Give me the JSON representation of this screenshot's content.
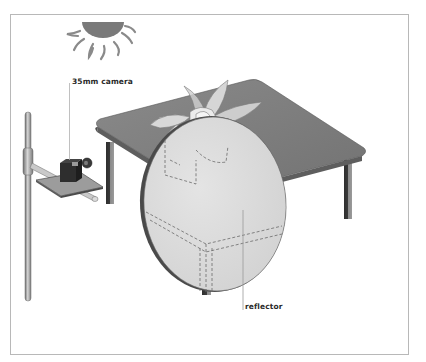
{
  "diagram": {
    "type": "illustration",
    "labels": {
      "camera": "35mm camera",
      "reflector": "reflector"
    },
    "elements": [
      "sun-icon",
      "camera-stand",
      "35mm-camera",
      "table",
      "flower",
      "reflector-disc"
    ],
    "colors": {
      "frame": "#b8b8b8",
      "sun": "#7a7a7a",
      "table_top": "#7d7d7d",
      "table_edge": "#5e5e5e",
      "reflector": "#dcdcdc",
      "flower": "#e6e6e6",
      "label_text": "#2a2a2a",
      "leader_line": "#9a9a9a"
    }
  }
}
